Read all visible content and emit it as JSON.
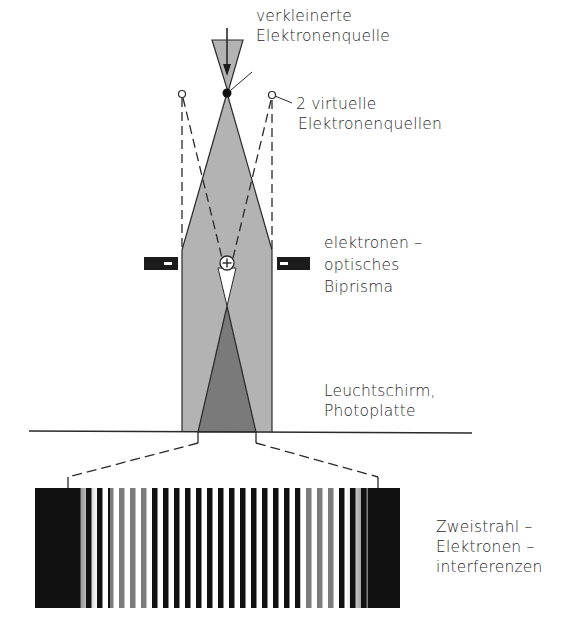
{
  "figure": {
    "colors": {
      "beam_light": "#b3b3b3",
      "beam_overlap": "#7a7a7a",
      "line": "#2a2a2a",
      "electrode": "#1c1c1c",
      "background": "#ffffff"
    },
    "labels": {
      "source": {
        "line1": "verkleinerte",
        "line2": "Elektronenquelle"
      },
      "virtual_sources": {
        "line1": "2 virtuelle",
        "line2": "Elektronenquellen"
      },
      "biprism": {
        "line1": "elektronen –",
        "line2": "optisches",
        "line3": "Biprisma"
      },
      "screen": {
        "line1": "Leuchtschirm,",
        "line2": "Photoplatte"
      },
      "fringes": {
        "line1": "Zweistrahl –",
        "line2": "Elektronen –",
        "line3": "interferenzen"
      }
    },
    "symbols": {
      "wire_charge": "+",
      "electrode_left_charge": "−",
      "electrode_right_charge": "−"
    },
    "fringe_pattern": {
      "stripe_count": 26,
      "x_start": 35,
      "x_end": 400,
      "y_top": 488,
      "y_bottom": 608
    }
  }
}
